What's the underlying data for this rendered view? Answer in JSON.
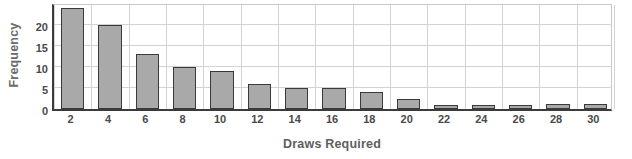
{
  "chart_data": {
    "type": "bar",
    "title": "",
    "xlabel": "Draws Required",
    "ylabel": "Frequency",
    "categories": [
      2,
      4,
      6,
      8,
      10,
      12,
      14,
      16,
      18,
      20,
      22,
      24,
      26,
      28,
      30
    ],
    "values": [
      24,
      20,
      13,
      10,
      9,
      6,
      5,
      5,
      4,
      2.5,
      1,
      1,
      1,
      1.2,
      1.2
    ],
    "xtick_labels": [
      "2",
      "4",
      "6",
      "8",
      "10",
      "12",
      "14",
      "16",
      "18",
      "20",
      "22",
      "24",
      "26",
      "28",
      "30"
    ],
    "ytick_labels": [
      "0",
      "5",
      "10",
      "15",
      "20"
    ],
    "yticks": [
      0,
      5,
      10,
      15,
      20
    ],
    "xlim": [
      1,
      31
    ],
    "ylim": [
      0,
      25.5
    ],
    "grid": true,
    "legend": false,
    "bar_color": "#a9a9a9",
    "bar_edge_color": "#3a3a3a",
    "axis_color": "#3b3b3b",
    "grid_color": "#d2d2d2",
    "label_color": "#4a4a4a"
  }
}
